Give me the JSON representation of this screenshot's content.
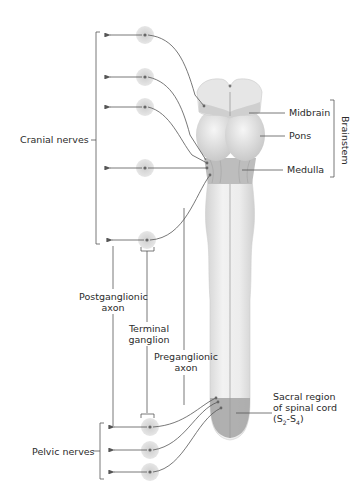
{
  "diagram": {
    "labels": {
      "cranial_nerves": "Cranial nerves",
      "midbrain": "Midbrain",
      "pons": "Pons",
      "medulla": "Medulla",
      "brainstem": "Brainstem",
      "postganglionic_line1": "Postganglionic",
      "postganglionic_line2": "axon",
      "terminal_line1": "Terminal",
      "terminal_line2": "ganglion",
      "preganglionic_line1": "Preganglionic",
      "preganglionic_line2": "axon",
      "sacral_line1": "Sacral region",
      "sacral_line2": "of spinal cord",
      "sacral_line3_prefix": "(S",
      "sacral_sub1": "2",
      "sacral_mid": "-S",
      "sacral_sub2": "4",
      "sacral_suffix": ")",
      "pelvic_nerves": "Pelvic nerves"
    },
    "cranial_ganglia_y": [
      35,
      77,
      107,
      168,
      240
    ],
    "pelvic_ganglia_y": [
      427,
      450,
      472
    ],
    "colors": {
      "line": "#555555",
      "ganglion_halo": "#d9d9d9",
      "tissue_light": "#eeeeee",
      "tissue_mid": "#d4d4d4",
      "sacral": "#a9a9a9",
      "text": "#2b2b2b"
    }
  }
}
